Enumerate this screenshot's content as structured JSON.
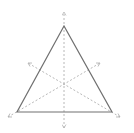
{
  "diagram": {
    "type": "equilateral-triangle-with-symmetry-axes",
    "colors": {
      "background": "#ffffff",
      "triangle_stroke": "#707070",
      "axis_stroke": "#b8b8b8"
    },
    "triangle": {
      "vertices": [
        [
          64,
          26
        ],
        [
          17,
          112
        ],
        [
          112,
          112
        ]
      ]
    },
    "axes": [
      {
        "name": "vertical-axis",
        "from": [
          64,
          128
        ],
        "to": [
          64,
          12
        ]
      },
      {
        "name": "left-diagonal-axis",
        "from": [
          120,
          117
        ],
        "to": [
          28,
          63
        ]
      },
      {
        "name": "right-diagonal-axis",
        "from": [
          8,
          117
        ],
        "to": [
          100,
          63
        ]
      }
    ]
  }
}
